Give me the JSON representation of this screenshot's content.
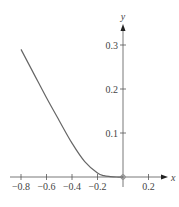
{
  "chart_data": {
    "type": "line",
    "title": "",
    "xlabel": "x",
    "ylabel": "y",
    "xlim": [
      -0.85,
      0.3
    ],
    "ylim": [
      0,
      0.33
    ],
    "grid": false,
    "legend": null,
    "x_ticks": [
      -0.8,
      -0.6,
      -0.4,
      -0.2,
      0.2
    ],
    "x_tick_labels": [
      "−0.8",
      "−0.6",
      "−0.4",
      "−0.2",
      "0.2"
    ],
    "y_ticks": [
      0.1,
      0.2,
      0.3
    ],
    "y_tick_labels": [
      "0.1",
      "0.2",
      "0.3"
    ],
    "series": [
      {
        "name": "curve",
        "x": [
          -0.8,
          -0.7,
          -0.6,
          -0.5,
          -0.4,
          -0.3,
          -0.2,
          -0.15,
          -0.1,
          -0.05,
          0.0
        ],
        "y": [
          0.29,
          0.235,
          0.18,
          0.128,
          0.077,
          0.035,
          0.009,
          0.003,
          0.001,
          0.0,
          0.0
        ],
        "color": "#666666"
      }
    ],
    "annotations": [
      {
        "type": "open-circle",
        "x": 0,
        "y": 0
      }
    ]
  },
  "colors": {
    "axis": "#555555",
    "curve": "#666666",
    "text": "#444444"
  }
}
